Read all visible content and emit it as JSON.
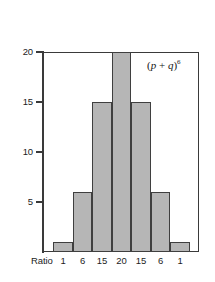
{
  "chart_data": {
    "type": "bar",
    "title": "",
    "subtitle": "",
    "xlabel": "Ratio",
    "ylabel": "",
    "categories": [
      "1",
      "6",
      "15",
      "20",
      "15",
      "6",
      "1"
    ],
    "values": [
      1,
      6,
      15,
      20,
      15,
      6,
      1
    ],
    "ylim": [
      0,
      20
    ],
    "xlim": [
      0,
      7
    ],
    "y_ticks": [
      5,
      10,
      15,
      20
    ],
    "y_tick_labels": [
      "5",
      "10",
      "15",
      "20"
    ],
    "x_tick_labels": [
      "1",
      "6",
      "15",
      "20",
      "15",
      "6",
      "1"
    ],
    "grid": false,
    "legend": null,
    "annotations": [
      {
        "text": "(p + q)6",
        "display": "(p + q)⁶",
        "base": "p + q",
        "exponent": "6",
        "position": "top-right-inside-plot"
      }
    ],
    "bar_fill_color": "#b6b6b6",
    "bar_edge_color": "#3f3f3f",
    "axis_color": "#3a3a3a",
    "background_color": "#ffffff"
  },
  "axis": {
    "x_title": "Ratio"
  },
  "annotation": {
    "open_paren": "(",
    "p": "p",
    "plus": " + ",
    "q": "q",
    "close_paren": ")",
    "exponent": "6"
  }
}
